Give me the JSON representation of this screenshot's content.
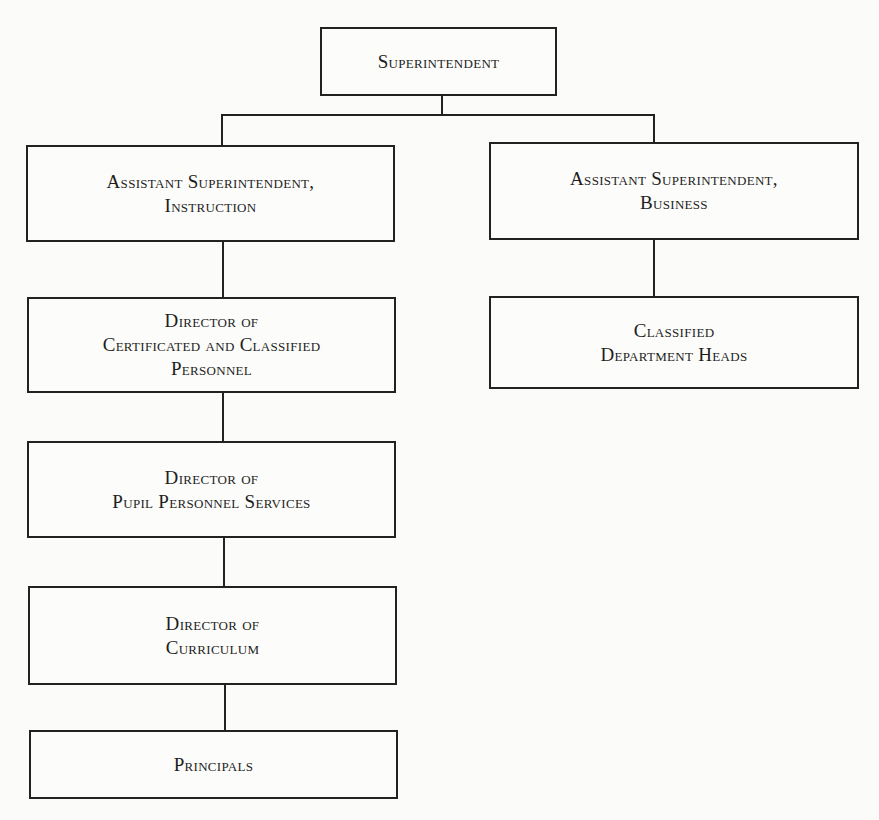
{
  "chart": {
    "type": "org-chart",
    "nodes": {
      "superintendent": {
        "lines": [
          "Superintendent"
        ]
      },
      "asst_instruction": {
        "lines": [
          "Assistant Superintendent,",
          "Instruction"
        ]
      },
      "asst_business": {
        "lines": [
          "Assistant Superintendent,",
          "Business"
        ]
      },
      "dir_personnel": {
        "lines": [
          "Director of",
          "Certificated and Classified",
          "Personnel"
        ]
      },
      "classified_heads": {
        "lines": [
          "Classified",
          "Department Heads"
        ]
      },
      "dir_pupil": {
        "lines": [
          "Director of",
          "Pupil Personnel Services"
        ]
      },
      "dir_curriculum": {
        "lines": [
          "Director of",
          "Curriculum"
        ]
      },
      "principals": {
        "lines": [
          "Principals"
        ]
      }
    },
    "edges": [
      [
        "superintendent",
        "asst_instruction"
      ],
      [
        "superintendent",
        "asst_business"
      ],
      [
        "asst_instruction",
        "dir_personnel"
      ],
      [
        "dir_personnel",
        "dir_pupil"
      ],
      [
        "dir_pupil",
        "dir_curriculum"
      ],
      [
        "dir_curriculum",
        "principals"
      ],
      [
        "asst_business",
        "classified_heads"
      ]
    ],
    "colors": {
      "line": "#222222",
      "background": "#fbfbf9"
    }
  }
}
